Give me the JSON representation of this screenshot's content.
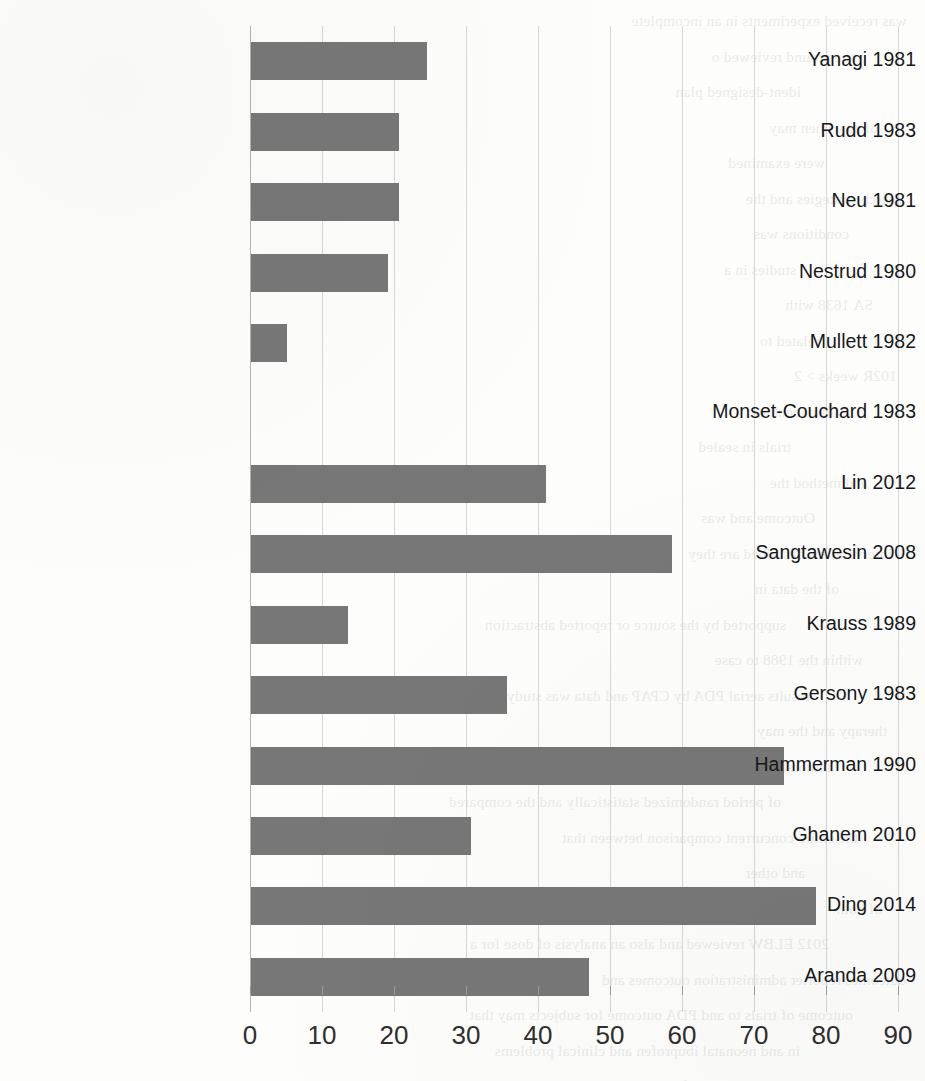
{
  "chart_data": {
    "type": "bar",
    "orientation": "horizontal",
    "title": "",
    "xlabel": "",
    "ylabel": "",
    "xlim": [
      0,
      90
    ],
    "xticks": [
      "0",
      "10",
      "20",
      "30",
      "40",
      "50",
      "60",
      "70",
      "80",
      "90"
    ],
    "grid": true,
    "legend": false,
    "bar_color": "#777777",
    "gridline_color": "#d6d6d6",
    "categories": [
      "Yanagi 1981",
      "Rudd 1983",
      "Neu 1981",
      "Nestrud 1980",
      "Mullett 1982",
      "Monset-Couchard 1983",
      "Lin 2012",
      "Sangtawesin 2008",
      "Krauss 1989",
      "Gersony 1983",
      "Hammerman 1990",
      "Ghanem 2010",
      "Ding 2014",
      "Aranda 2009"
    ],
    "values": [
      24.5,
      20.5,
      20.5,
      19,
      5,
      0,
      41,
      58.5,
      13.5,
      35.5,
      74,
      30.5,
      78.5,
      47
    ]
  },
  "background_text": {
    "note": "faint mirrored bleed-through from the reverse side of the scanned page",
    "lines": [
      "was received experiments in an incomplete",
      "the around reviewed o",
      "ident-designed plan",
      "of specimen may",
      "were examined",
      "search strategies and the",
      "conditions was",
      "studies in a",
      "SA 1638 with",
      "related to",
      "102R weeks > 2",
      "subsequent and",
      "trials in sealed",
      "and method the",
      "Outcome and was",
      "interventions described are they",
      "of the data in",
      "supported by the source or reported abstraction",
      "within the 1988 to case",
      "results aerial PDA by CPAP and data was study",
      "therapy and the may",
      "authorship for a",
      "of period randomized statistically and the compared",
      "the entire concurrent comparison between that",
      "and other",
      "of both",
      "2012 ELBW reviewed and also an analysis of dose for a",
      "outcomes reporter administration outcomes and",
      "outcome of trials to and PDA outcome for subjects may that",
      "in and neonatal ibuprofen and clinical problems",
      "randomized statistically significant"
    ]
  }
}
